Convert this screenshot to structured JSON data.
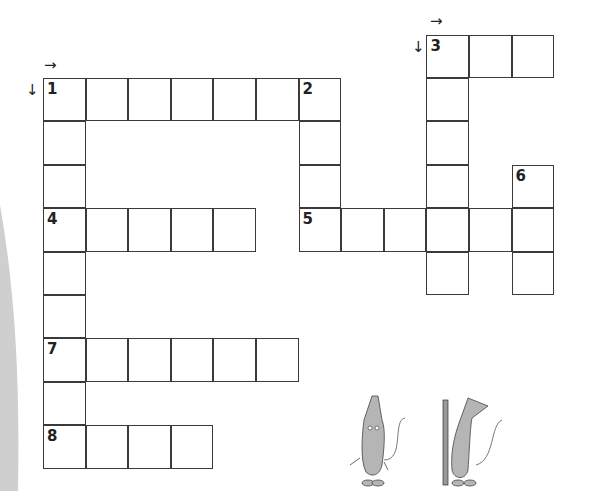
{
  "puzzle": {
    "type": "crossword",
    "cell_size_px": 42.6,
    "origin": {
      "x": 43,
      "y": 78
    },
    "clues": [
      {
        "number": "1",
        "direction": "across",
        "row": 0,
        "col": 0,
        "length": 7
      },
      {
        "number": "1",
        "direction": "down",
        "row": 0,
        "col": 0,
        "length": 9
      },
      {
        "number": "2",
        "direction": "down",
        "row": 0,
        "col": 6,
        "length": 4
      },
      {
        "number": "3",
        "direction": "across",
        "row": -1,
        "col": 9,
        "length": 3
      },
      {
        "number": "3",
        "direction": "down",
        "row": -1,
        "col": 9,
        "length": 6
      },
      {
        "number": "4",
        "direction": "across",
        "row": 3,
        "col": 0,
        "length": 5
      },
      {
        "number": "5",
        "direction": "across",
        "row": 3,
        "col": 6,
        "length": 6
      },
      {
        "number": "6",
        "direction": "down",
        "row": 2,
        "col": 11,
        "length": 3
      },
      {
        "number": "7",
        "direction": "across",
        "row": 6,
        "col": 0,
        "length": 6
      },
      {
        "number": "8",
        "direction": "across",
        "row": 8,
        "col": 0,
        "length": 4
      }
    ],
    "labels": [
      {
        "text": "1",
        "row": 0,
        "col": 0
      },
      {
        "text": "2",
        "row": 0,
        "col": 6
      },
      {
        "text": "3",
        "row": -1,
        "col": 9
      },
      {
        "text": "4",
        "row": 3,
        "col": 0
      },
      {
        "text": "5",
        "row": 3,
        "col": 6
      },
      {
        "text": "6",
        "row": 2,
        "col": 11
      },
      {
        "text": "7",
        "row": 6,
        "col": 0
      },
      {
        "text": "8",
        "row": 8,
        "col": 0
      }
    ],
    "arrows": {
      "right": "→",
      "down": "↓"
    }
  },
  "illustration": {
    "subject": "two cartoon mice, one holding a pencil"
  }
}
